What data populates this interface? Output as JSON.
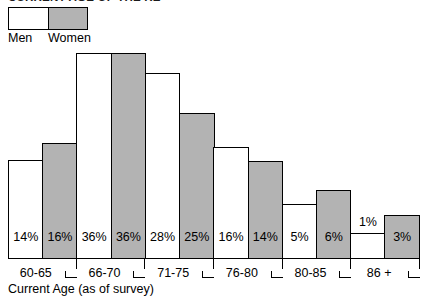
{
  "chart_data": {
    "type": "bar",
    "title": "CURRENT AGE OF THE RE",
    "xlabel": "Current Age (as of survey)",
    "ylabel": "",
    "grid": false,
    "legend_position": "top-left",
    "categories": [
      "60-65",
      "66-70",
      "71-75",
      "76-80",
      "80-85",
      "86 +"
    ],
    "series": [
      {
        "name": "Men",
        "color": "#ffffff",
        "values": [
          14,
          16,
          28,
          16,
          5,
          1
        ],
        "value_labels": [
          "14%",
          "16%",
          "28%",
          "16%",
          "5%",
          "1%"
        ],
        "bar_heights_px": [
          98,
          185,
          145,
          111,
          54,
          25
        ]
      },
      {
        "name": "Women",
        "color": "#b3b3b3",
        "values": [
          16,
          36,
          25,
          14,
          6,
          3
        ],
        "value_labels": [
          "16%",
          "36%",
          "25%",
          "14%",
          "6%",
          "3%"
        ],
        "bar_heights_px": [
          115,
          205,
          115,
          97,
          68,
          43
        ]
      }
    ],
    "bars": [
      {
        "category": "60-65",
        "series": "Men",
        "label": "14%",
        "value": 14,
        "height_px": 98,
        "fill": "#ffffff"
      },
      {
        "category": "60-65",
        "series": "Women",
        "label": "16%",
        "value": 16,
        "height_px": 115,
        "fill": "#b3b3b3"
      },
      {
        "category": "66-70",
        "series": "Men",
        "label": "36%",
        "value": 36,
        "height_px": 205,
        "fill": "#ffffff"
      },
      {
        "category": "66-70",
        "series": "Women",
        "label": "36%",
        "value": 36,
        "height_px": 205,
        "fill": "#b3b3b3"
      },
      {
        "category": "71-75",
        "series": "Men",
        "label": "28%",
        "value": 28,
        "height_px": 185,
        "fill": "#ffffff"
      },
      {
        "category": "71-75",
        "series": "Women",
        "label": "25%",
        "value": 25,
        "height_px": 145,
        "fill": "#b3b3b3"
      },
      {
        "category": "76-80",
        "series": "Men",
        "label": "16%",
        "value": 16,
        "height_px": 111,
        "fill": "#ffffff"
      },
      {
        "category": "76-80",
        "series": "Women",
        "label": "14%",
        "value": 14,
        "height_px": 97,
        "fill": "#b3b3b3"
      },
      {
        "category": "80-85",
        "series": "Men",
        "label": "5%",
        "value": 5,
        "height_px": 54,
        "fill": "#ffffff"
      },
      {
        "category": "80-85",
        "series": "Women",
        "label": "6%",
        "value": 6,
        "height_px": 68,
        "fill": "#b3b3b3"
      },
      {
        "category": "86 +",
        "series": "Men",
        "label": "1%",
        "value": 1,
        "height_px": 25,
        "fill": "#ffffff"
      },
      {
        "category": "86 +",
        "series": "Women",
        "label": "3%",
        "value": 3,
        "height_px": 43,
        "fill": "#b3b3b3"
      }
    ]
  },
  "legend": {
    "men_label": "Men",
    "women_label": "Women",
    "men_color": "#b3b3b3",
    "women_color": "#b3b3b3"
  }
}
